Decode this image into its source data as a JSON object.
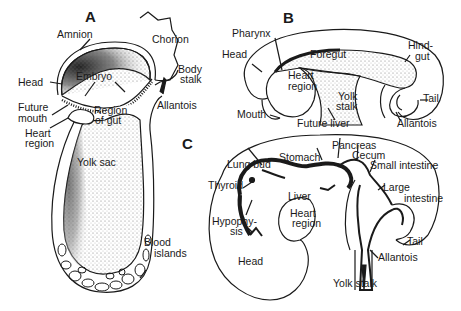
{
  "figure": {
    "panels": [
      {
        "id": "A",
        "label": "A"
      },
      {
        "id": "B",
        "label": "B"
      },
      {
        "id": "C",
        "label": "C"
      }
    ],
    "panel_a": {
      "amnion": "Amnion",
      "chorion": "Chorion",
      "embryo": "Embryo",
      "head": "Head",
      "body_stalk_1": "Body",
      "body_stalk_2": "stalk",
      "future_mouth_1": "Future",
      "future_mouth_2": "mouth",
      "region_of_gut_1": "Region",
      "region_of_gut_2": "of gut",
      "allantois": "Allantois",
      "heart_region_1": "Heart",
      "heart_region_2": "region",
      "yolk_sac": "Yolk sac",
      "blood_islands_1": "Blood",
      "blood_islands_2": "islands"
    },
    "panel_b": {
      "pharynx": "Pharynx",
      "head": "Head",
      "foregut": "Foregut",
      "hindgut_1": "Hind-",
      "hindgut_2": "gut",
      "heart_region_1": "Heart",
      "heart_region_2": "region",
      "yolk_stalk_1": "Yolk",
      "yolk_stalk_2": "stalk",
      "tail": "Tail",
      "mouth": "Mouth",
      "future_liver": "Future liver",
      "allantois": "Allantois"
    },
    "panel_c": {
      "lung_bud": "Lung bud",
      "stomach": "Stomach",
      "pancreas": "Pancreas",
      "cecum": "Cecum",
      "small_intestine": "Small intestine",
      "thyroid": "Thyroid",
      "liver": "Liver",
      "large_intestine_1": "Large",
      "large_intestine_2": "intestine",
      "hypophysis_1": "Hypophy-",
      "hypophysis_2": "sis",
      "heart_region_1": "Heart",
      "heart_region_2": "region",
      "tail": "Tail",
      "allantois": "Allantois",
      "head": "Head",
      "yolk_stalk": "Yolk stalk"
    }
  }
}
